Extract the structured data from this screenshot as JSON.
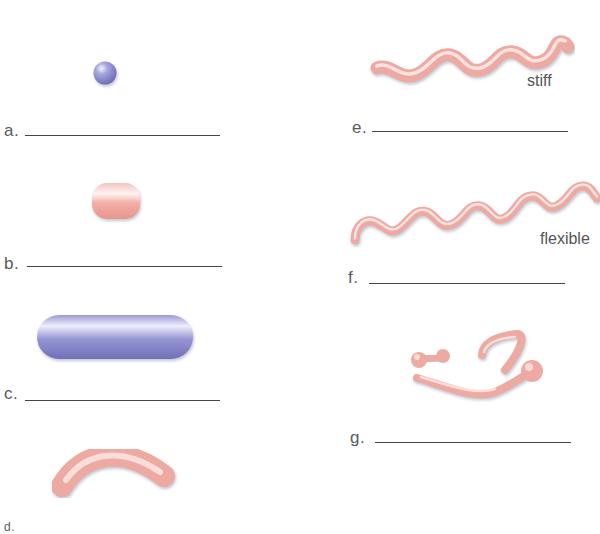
{
  "worksheet": {
    "top_text_cut": "",
    "items": [
      {
        "letter": "a.",
        "shape": "sphere (coccus)",
        "color": "#8f8fd0",
        "note": ""
      },
      {
        "letter": "b.",
        "shape": "short rod (coccobacillus)",
        "color": "#f0a8a0",
        "note": ""
      },
      {
        "letter": "c.",
        "shape": "rod (bacillus)",
        "color": "#8f8fd0",
        "note": ""
      },
      {
        "letter": "d.",
        "shape": "curved rod (vibrio)",
        "color": "#f0a8a0",
        "note": ""
      },
      {
        "letter": "e.",
        "shape": "stiff spiral (spirillum)",
        "color": "#f0a8a0",
        "note": "stiff"
      },
      {
        "letter": "f.",
        "shape": "flexible spiral (spirochete)",
        "color": "#f0a8a0",
        "note": "flexible"
      },
      {
        "letter": "g.",
        "shape": "pleomorphic / club-shaped",
        "color": "#f0a8a0",
        "note": ""
      }
    ]
  },
  "colors": {
    "blue_shape": "#8f8fd0",
    "pink_shape": "#f0a8a0",
    "text": "#555555",
    "line": "#444444"
  }
}
